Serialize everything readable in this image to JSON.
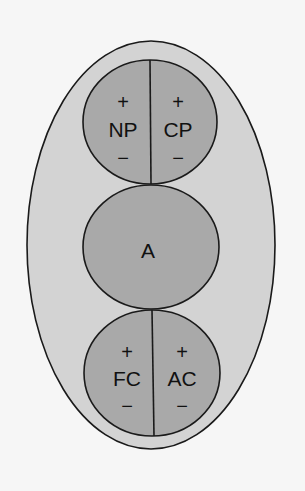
{
  "colors": {
    "background": "#f6f6f6",
    "outer_fill": "#d3d3d3",
    "inner_fill": "#a9a9a9",
    "stroke": "#1a1a1a",
    "text": "#111111"
  },
  "diagram": {
    "type": "nested-ellipse",
    "top_circle": {
      "left": {
        "label": "NP",
        "plus": "+",
        "minus": "−"
      },
      "right": {
        "label": "CP",
        "plus": "+",
        "minus": "−"
      }
    },
    "middle_circle": {
      "label": "A"
    },
    "bottom_circle": {
      "left": {
        "label": "FC",
        "plus": "+",
        "minus": "−"
      },
      "right": {
        "label": "AC",
        "plus": "+",
        "minus": "−"
      }
    }
  }
}
